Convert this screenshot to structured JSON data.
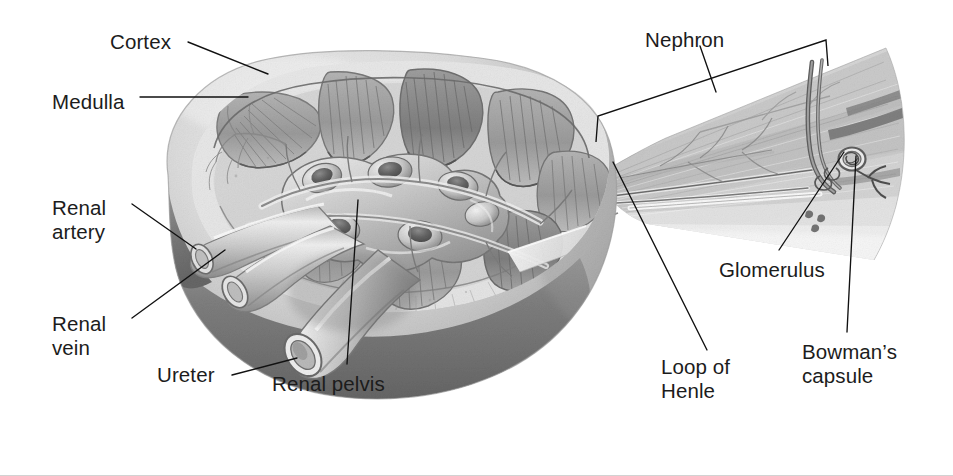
{
  "figure": {
    "background_color": "#ffffff",
    "text_color": "#1c1c1c",
    "leader_line_color": "#111111",
    "width": 953,
    "height": 476
  },
  "labels": [
    {
      "id": "cortex",
      "text": "Cortex",
      "x": 110,
      "y": 30,
      "align": "left"
    },
    {
      "id": "medulla",
      "text": "Medulla",
      "x": 52,
      "y": 90,
      "align": "left"
    },
    {
      "id": "renal_artery",
      "text": "Renal\nartery",
      "x": 52,
      "y": 196,
      "align": "left"
    },
    {
      "id": "renal_vein",
      "text": "Renal\nvein",
      "x": 52,
      "y": 312,
      "align": "left"
    },
    {
      "id": "ureter",
      "text": "Ureter",
      "x": 157,
      "y": 363,
      "align": "left"
    },
    {
      "id": "renal_pelvis",
      "text": "Renal pelvis",
      "x": 272,
      "y": 372,
      "align": "left"
    },
    {
      "id": "nephron",
      "text": "Nephron",
      "x": 645,
      "y": 28,
      "align": "left"
    },
    {
      "id": "loop_of_henle",
      "text": "Loop of\nHenle",
      "x": 661,
      "y": 355,
      "align": "left"
    },
    {
      "id": "glomerulus",
      "text": "Glomerulus",
      "x": 719,
      "y": 258,
      "align": "left"
    },
    {
      "id": "bowmans_capsule",
      "text": "Bowman’s\ncapsule",
      "x": 802,
      "y": 340,
      "align": "left"
    }
  ],
  "leader_lines": [
    {
      "id": "cortex-leader",
      "points": "188,42 268,74"
    },
    {
      "id": "medulla-leader",
      "points": "140,97 248,97"
    },
    {
      "id": "renal-artery-leader",
      "points": "132,204 196,249"
    },
    {
      "id": "renal-vein-leader",
      "points": "132,318 225,250"
    },
    {
      "id": "ureter-leader",
      "points": "232,375 297,358"
    },
    {
      "id": "renal-pelvis-leader",
      "points": "358,200 347,364"
    },
    {
      "id": "nephron-leader",
      "points": "700,46 716,92"
    },
    {
      "id": "loop-of-henle-leader",
      "points": "613,162 707,350"
    },
    {
      "id": "glomerulus-leader",
      "points": "844,152 779,250"
    },
    {
      "id": "bowmans-capsule-leader",
      "points": "856,156 847,332"
    }
  ],
  "brackets": [
    {
      "id": "nephron-bracket",
      "path": "M 596,142 L 598,116 L 826,40 L 828,66",
      "note": "slanted bracket spanning the magnified nephron wedge"
    }
  ],
  "artwork": {
    "description": "Grayscale airbrush-style medical illustration of a sectioned human kidney on the left with renal artery, renal vein and ureter emerging from the hilum, plus a magnified pie-slice wedge of kidney tissue on the right showing a single nephron with its glomerulus, Bowman's capsule and loop of Henle.",
    "palette": {
      "paper": "#ffffff",
      "cortex_light": "#dcdcdc",
      "cortex_mid": "#c7c7c7",
      "pyramid_mid": "#a9a9a9",
      "pyramid_dark": "#8a8a8a",
      "outline": "#6d6d6d",
      "capsule_dark": "#6f6f6f",
      "shadow_dark": "#585858",
      "vessel_light": "#e4e4e4",
      "vessel_mid": "#b5b5b5",
      "vessel_dark": "#7a7a7a",
      "wedge_tissue": "#c9c9c9",
      "wedge_tissue_light": "#dedede",
      "tubule_dark": "#5f5f5f"
    },
    "structures": [
      "renal cortex (outer pale band)",
      "renal medulla (fan-shaped pyramids)",
      "renal columns",
      "renal pelvis and major calyces",
      "renal artery (upper cut tube)",
      "renal vein (lower cut tube)",
      "ureter (large cut tube, lower left)",
      "magnified nephron wedge",
      "glomerulus",
      "Bowman's capsule",
      "loop of Henle",
      "collecting duct"
    ],
    "pyramids_count": 8
  }
}
